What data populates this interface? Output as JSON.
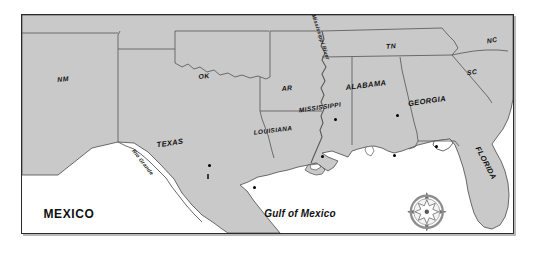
{
  "map": {
    "title": "Southern United States and Gulf of Mexico reference map",
    "colors": {
      "land": "#c9c9c9",
      "water": "#ffffff",
      "border_line": "#5a5a5a",
      "frame": "#2b2b2b",
      "label_text": "#111111"
    },
    "states": [
      {
        "id": "nm",
        "label": "NM",
        "x": 41,
        "y": 64,
        "rotate": -6,
        "size": "sm"
      },
      {
        "id": "ok",
        "label": "OK",
        "x": 182,
        "y": 61,
        "rotate": -6,
        "size": "sm"
      },
      {
        "id": "tx",
        "label": "TEXAS",
        "x": 148,
        "y": 128,
        "rotate": -8,
        "size": "norm"
      },
      {
        "id": "ar",
        "label": "AR",
        "x": 265,
        "y": 73,
        "rotate": -6,
        "size": "sm"
      },
      {
        "id": "la",
        "label": "LOUISIANA",
        "x": 251,
        "y": 115,
        "rotate": -7,
        "size": "tiny"
      },
      {
        "id": "ms",
        "label": "MISSISSIPPI",
        "x": 298,
        "y": 92,
        "rotate": -8,
        "size": "tiny"
      },
      {
        "id": "al",
        "label": "ALABAMA",
        "x": 344,
        "y": 70,
        "rotate": -7,
        "size": "norm"
      },
      {
        "id": "ga",
        "label": "GEORGIA",
        "x": 405,
        "y": 86,
        "rotate": -8,
        "size": "norm"
      },
      {
        "id": "tn",
        "label": "TN",
        "x": 369,
        "y": 31,
        "rotate": -6,
        "size": "sm"
      },
      {
        "id": "nc",
        "label": "NC",
        "x": 470,
        "y": 25,
        "rotate": -10,
        "size": "sm"
      },
      {
        "id": "sc",
        "label": "SC",
        "x": 450,
        "y": 57,
        "rotate": -8,
        "size": "sm"
      },
      {
        "id": "fl",
        "label": "FLORIDA",
        "x": 464,
        "y": 148,
        "rotate": 62,
        "size": "norm"
      }
    ],
    "countries": [
      {
        "id": "mexico",
        "label": "MEXICO",
        "x": 47,
        "y": 199
      }
    ],
    "water_bodies": [
      {
        "id": "gulf-of-mexico",
        "label": "Gulf of Mexico",
        "x": 278,
        "y": 198
      }
    ],
    "rivers": [
      {
        "id": "mississippi-river",
        "label": "Mississippi River",
        "x": 299,
        "y": 22,
        "rotate": 72
      },
      {
        "id": "rio-grande",
        "label": "Rio Grande",
        "x": 121,
        "y": 147,
        "rotate": 52
      }
    ],
    "city_markers": [
      {
        "id": "marker-tx-central",
        "x": 187,
        "y": 150
      },
      {
        "id": "marker-tx-coast",
        "x": 232,
        "y": 172
      },
      {
        "id": "marker-la-south",
        "x": 300,
        "y": 141
      },
      {
        "id": "marker-ms-central",
        "x": 313,
        "y": 104
      },
      {
        "id": "marker-al-central",
        "x": 375,
        "y": 100
      },
      {
        "id": "marker-al-coast",
        "x": 372,
        "y": 140
      },
      {
        "id": "marker-ga-southeast",
        "x": 414,
        "y": 131
      }
    ],
    "city_ticks": [
      {
        "id": "tick-tx-interior",
        "x": 186,
        "y": 161
      }
    ],
    "compass": {
      "id": "compass-rose",
      "x": 405,
      "y": 197,
      "radius": 16,
      "points": [
        "N",
        "E",
        "S",
        "W"
      ]
    }
  }
}
